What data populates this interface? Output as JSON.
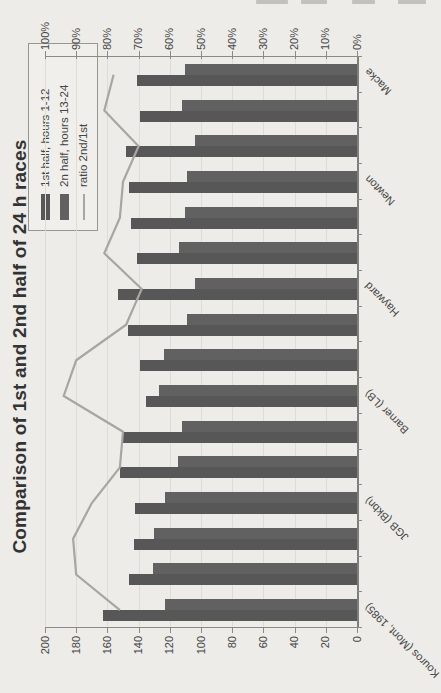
{
  "page": {
    "description_label": "scanned page with rotated chart"
  },
  "chart_data": {
    "type": "bar",
    "combo": "bar+line",
    "title": "Comparison of 1st and 2nd half of 24 h races",
    "orientation_in_scan": "rotated 90deg counterclockwise",
    "categories": [
      "Kouros (Mont, 1985)",
      "",
      "",
      "JGB (Bkbn)",
      "",
      "",
      "Barner (LB)",
      "",
      "",
      "Hayward",
      "",
      "",
      "Newton",
      "",
      "",
      "Macke"
    ],
    "series": [
      {
        "name": "1st half, hours 1-12",
        "type": "bar",
        "axis": "primary",
        "values": [
          163,
          146,
          143,
          142,
          152,
          150,
          135,
          139,
          147,
          153,
          141,
          145,
          146,
          148,
          139,
          141
        ]
      },
      {
        "name": "2n half, hours 13-24",
        "type": "bar",
        "axis": "primary",
        "values": [
          123,
          131,
          130,
          123,
          115,
          112,
          127,
          124,
          109,
          104,
          114,
          110,
          109,
          104,
          112,
          110
        ]
      },
      {
        "name": "ratio 2nd/1st",
        "type": "line",
        "axis": "secondary",
        "values": [
          76,
          90,
          91,
          85,
          76,
          75,
          94,
          90,
          74,
          69,
          81,
          76,
          75,
          70,
          81,
          78
        ]
      }
    ],
    "primary_axis": {
      "min": 0,
      "max": 200,
      "step": 20,
      "ticks": [
        "0",
        "20",
        "40",
        "60",
        "80",
        "100",
        "120",
        "140",
        "160",
        "180",
        "200"
      ]
    },
    "secondary_axis": {
      "min": 0,
      "max": 100,
      "step": 10,
      "ticks": [
        "0%",
        "10%",
        "20%",
        "30%",
        "40%",
        "50%",
        "60%",
        "70%",
        "80%",
        "90%",
        "100%"
      ]
    },
    "legend_position": "top-right-inside",
    "grid": true
  },
  "colors": {
    "bar_1st_half": "#575757",
    "bar_2nd_half": "#616161",
    "ratio_line": "#a7a6a2",
    "axis_line": "#8b8a86",
    "category_axis_line": "#7f7e7a",
    "grid_line": "#dddcd7",
    "text": "#454545",
    "title_text": "#333333",
    "legend_border": "#98978f",
    "legend_bg": "#f0efeb",
    "page_bg": "#edece8",
    "artifact": "#c2c1bd"
  }
}
